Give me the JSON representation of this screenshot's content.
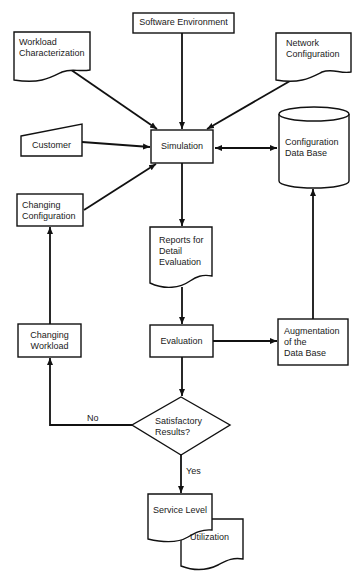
{
  "diagram": {
    "type": "flowchart",
    "colors": {
      "stroke": "#111111",
      "fill": "#ffffff",
      "text": "#1a1a1a"
    },
    "nodes": {
      "software_environment": {
        "shape": "process",
        "label": "Software Environment"
      },
      "workload_characterization": {
        "shape": "document",
        "label": "Workload\nCharacterization"
      },
      "network_configuration": {
        "shape": "document",
        "label": "Network\nConfiguration"
      },
      "customer": {
        "shape": "manual-input",
        "label": "Customer"
      },
      "simulation": {
        "shape": "process",
        "label": "Simulation"
      },
      "configuration_data_base": {
        "shape": "database",
        "label": "Configuration\nData Base"
      },
      "changing_configuration": {
        "shape": "process",
        "label": "Changing\nConfiguration"
      },
      "reports_for_detail_evaluation": {
        "shape": "document",
        "label": "Reports for\nDetail\nEvaluation"
      },
      "changing_workload": {
        "shape": "process",
        "label": "Changing\nWorkload"
      },
      "evaluation": {
        "shape": "process",
        "label": "Evaluation"
      },
      "augmentation": {
        "shape": "process",
        "label": "Augmentation\nof the\nData Base"
      },
      "satisfactory_results": {
        "shape": "decision",
        "label": "Satisfactory\nResults?"
      },
      "service_level": {
        "shape": "document",
        "label": "Service Level"
      },
      "utilization": {
        "shape": "document",
        "label": "Utilization"
      }
    },
    "edges": [
      {
        "from": "software_environment",
        "to": "simulation"
      },
      {
        "from": "workload_characterization",
        "to": "simulation"
      },
      {
        "from": "network_configuration",
        "to": "simulation"
      },
      {
        "from": "customer",
        "to": "simulation"
      },
      {
        "from": "changing_configuration",
        "to": "simulation"
      },
      {
        "from": "simulation",
        "to": "configuration_data_base",
        "bidirectional": true
      },
      {
        "from": "simulation",
        "to": "reports_for_detail_evaluation"
      },
      {
        "from": "reports_for_detail_evaluation",
        "to": "evaluation"
      },
      {
        "from": "evaluation",
        "to": "augmentation"
      },
      {
        "from": "augmentation",
        "to": "configuration_data_base"
      },
      {
        "from": "evaluation",
        "to": "satisfactory_results"
      },
      {
        "from": "satisfactory_results",
        "to": "changing_workload",
        "label": "No"
      },
      {
        "from": "changing_workload",
        "to": "changing_configuration"
      },
      {
        "from": "satisfactory_results",
        "to": "service_level",
        "label": "Yes"
      }
    ],
    "edge_labels": {
      "no": "No",
      "yes": "Yes"
    }
  }
}
